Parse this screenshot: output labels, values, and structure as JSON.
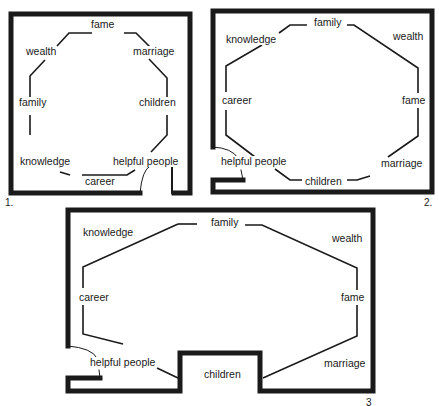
{
  "figures": [
    {
      "number": "1.",
      "labels": {
        "top": "fame",
        "top_left": "wealth",
        "top_right": "marriage",
        "left": "family",
        "right": "children",
        "bottom_left": "knowledge",
        "bottom_right": "helpful people",
        "bottom": "career"
      }
    },
    {
      "number": "2.",
      "labels": {
        "top": "family",
        "top_left": "knowledge",
        "top_right": "wealth",
        "left": "career",
        "right": "fame",
        "bottom_left": "helpful people",
        "bottom_right": "marriage",
        "bottom": "children"
      }
    },
    {
      "number": "3",
      "labels": {
        "top": "family",
        "top_left": "knowledge",
        "top_right": "wealth",
        "left": "career",
        "right": "fame",
        "bottom_left": "helpful people",
        "bottom_right": "marriage",
        "bottom": "children"
      }
    }
  ],
  "colors": {
    "ink": "#1a1a1a",
    "background": "#ffffff"
  }
}
